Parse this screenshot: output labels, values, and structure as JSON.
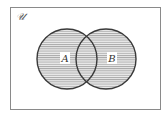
{
  "diagram": {
    "type": "venn",
    "universe_label": "𝒰",
    "sets": [
      {
        "label": "A",
        "cx": 67,
        "cy": 59,
        "r": 30
      },
      {
        "label": "B",
        "cx": 106,
        "cy": 59,
        "r": 30
      }
    ],
    "shaded_region": "A ∪ B",
    "colors": {
      "stroke": "#3a3a3a",
      "hatch": "#9a9a9a",
      "fill": "#e6e6e6",
      "border": "#8a8a8a"
    }
  }
}
